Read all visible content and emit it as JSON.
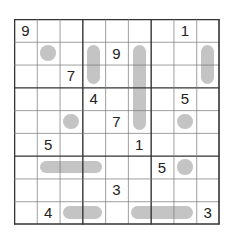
{
  "puzzle": {
    "size": 9,
    "colors": {
      "shape": "#c4c4c4",
      "thin_line": "#777777",
      "thick_line": "#333333",
      "digit": "#222222"
    },
    "givens": [
      {
        "r": 1,
        "c": 1,
        "v": "9"
      },
      {
        "r": 1,
        "c": 8,
        "v": "1"
      },
      {
        "r": 2,
        "c": 5,
        "v": "9"
      },
      {
        "r": 3,
        "c": 3,
        "v": "7"
      },
      {
        "r": 4,
        "c": 4,
        "v": "4"
      },
      {
        "r": 4,
        "c": 8,
        "v": "5"
      },
      {
        "r": 5,
        "c": 5,
        "v": "7"
      },
      {
        "r": 6,
        "c": 2,
        "v": "5"
      },
      {
        "r": 6,
        "c": 6,
        "v": "1"
      },
      {
        "r": 7,
        "c": 7,
        "v": "5"
      },
      {
        "r": 8,
        "c": 5,
        "v": "3"
      },
      {
        "r": 9,
        "c": 2,
        "v": "4"
      },
      {
        "r": 9,
        "c": 9,
        "v": "3"
      }
    ],
    "circles": [
      {
        "r": 2,
        "c": 2
      },
      {
        "r": 5,
        "c": 3
      },
      {
        "r": 5,
        "c": 8
      },
      {
        "r": 7,
        "c": 8
      }
    ],
    "vertical_bars": [
      {
        "c": 4,
        "r1": 2,
        "r2": 3
      },
      {
        "c": 6,
        "r1": 2,
        "r2": 5
      },
      {
        "c": 9,
        "r1": 2,
        "r2": 3
      }
    ],
    "horizontal_bars": [
      {
        "r": 7,
        "c1": 2,
        "c2": 4
      },
      {
        "r": 9,
        "c1": 3,
        "c2": 4
      },
      {
        "r": 9,
        "c1": 6,
        "c2": 8
      }
    ]
  }
}
